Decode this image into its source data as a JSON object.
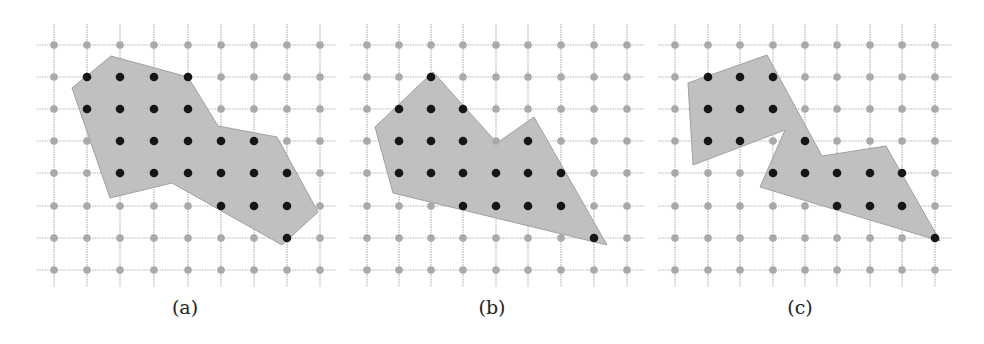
{
  "figure": {
    "colors": {
      "grid_line": "#b5b5b5",
      "grid_point": "#a9a9a9",
      "polygon_fill": "#bdbdbd",
      "polygon_stroke": "#a0a0a0",
      "lattice_point_inside": "#161616"
    },
    "grid": {
      "rows": 8,
      "cols": 9,
      "row_y": [
        45,
        77,
        109,
        141,
        173,
        206,
        238,
        270
      ],
      "line_top": 24,
      "line_bottom": 287
    },
    "panels": [
      {
        "label": "(a)",
        "label_x": 185,
        "col_x": [
          54,
          87,
          120,
          154,
          188,
          221,
          254,
          287,
          320
        ],
        "line_left": 37,
        "line_right": 336,
        "polygon": [
          [
            72,
            88
          ],
          [
            111,
            56
          ],
          [
            188,
            77
          ],
          [
            218,
            126
          ],
          [
            277,
            137
          ],
          [
            318,
            212
          ],
          [
            282,
            245
          ],
          [
            172,
            183
          ],
          [
            110,
            198
          ]
        ],
        "inside_points": [
          [
            1,
            1
          ],
          [
            2,
            1
          ],
          [
            3,
            1
          ],
          [
            4,
            1
          ],
          [
            1,
            2
          ],
          [
            2,
            2
          ],
          [
            3,
            2
          ],
          [
            4,
            2
          ],
          [
            2,
            3
          ],
          [
            3,
            3
          ],
          [
            4,
            3
          ],
          [
            5,
            3
          ],
          [
            6,
            3
          ],
          [
            2,
            4
          ],
          [
            3,
            4
          ],
          [
            4,
            4
          ],
          [
            5,
            4
          ],
          [
            6,
            4
          ],
          [
            7,
            4
          ],
          [
            5,
            5
          ],
          [
            6,
            5
          ],
          [
            7,
            5
          ],
          [
            7,
            6
          ]
        ]
      },
      {
        "label": "(b)",
        "label_x": 492,
        "col_x": [
          367,
          399,
          431,
          463,
          496,
          528,
          561,
          594,
          627
        ],
        "line_left": 350,
        "line_right": 644,
        "polygon": [
          [
            375,
            127
          ],
          [
            433,
            72
          ],
          [
            497,
            143
          ],
          [
            534,
            117
          ],
          [
            607,
            245
          ],
          [
            393,
            193
          ]
        ],
        "inside_points": [
          [
            2,
            1
          ],
          [
            1,
            2
          ],
          [
            2,
            2
          ],
          [
            3,
            2
          ],
          [
            1,
            3
          ],
          [
            2,
            3
          ],
          [
            3,
            3
          ],
          [
            5,
            3
          ],
          [
            1,
            4
          ],
          [
            2,
            4
          ],
          [
            3,
            4
          ],
          [
            4,
            4
          ],
          [
            5,
            4
          ],
          [
            6,
            4
          ],
          [
            3,
            5
          ],
          [
            4,
            5
          ],
          [
            5,
            5
          ],
          [
            6,
            5
          ],
          [
            7,
            6
          ]
        ]
      },
      {
        "label": "(c)",
        "label_x": 800,
        "col_x": [
          675,
          708,
          740,
          773,
          805,
          837,
          870,
          902,
          935
        ],
        "line_left": 658,
        "line_right": 952,
        "polygon": [
          [
            688,
            83
          ],
          [
            767,
            55
          ],
          [
            822,
            156
          ],
          [
            886,
            146
          ],
          [
            940,
            241
          ],
          [
            760,
            187
          ],
          [
            785,
            130
          ],
          [
            693,
            165
          ]
        ],
        "inside_points": [
          [
            1,
            1
          ],
          [
            2,
            1
          ],
          [
            3,
            1
          ],
          [
            1,
            2
          ],
          [
            2,
            2
          ],
          [
            3,
            2
          ],
          [
            1,
            3
          ],
          [
            2,
            3
          ],
          [
            4,
            3
          ],
          [
            3,
            4
          ],
          [
            4,
            4
          ],
          [
            5,
            4
          ],
          [
            6,
            4
          ],
          [
            7,
            4
          ],
          [
            5,
            5
          ],
          [
            6,
            5
          ],
          [
            7,
            5
          ],
          [
            8,
            6
          ]
        ]
      }
    ]
  }
}
